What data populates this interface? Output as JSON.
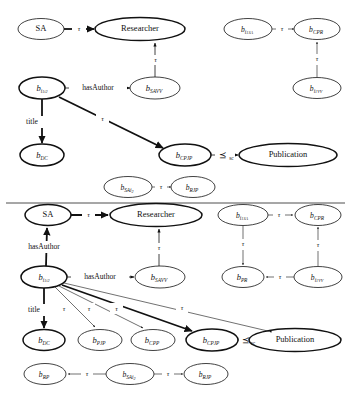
{
  "figure": {
    "type": "two-panel-graph-diagram",
    "divider_y": 203,
    "panels": [
      {
        "id": "top-panel",
        "name": "upper-graph",
        "nodes": [
          {
            "id": "t_SA",
            "label": "SA",
            "base": "SA",
            "sub": "",
            "sub2": "",
            "italic": false,
            "bold": false,
            "cx": 41,
            "cy": 29,
            "rx": 23,
            "ry": 10.5
          },
          {
            "id": "t_RES",
            "label": "Researcher",
            "base": "Researcher",
            "sub": "",
            "sub2": "",
            "italic": false,
            "bold": true,
            "cx": 140,
            "cy": 29,
            "rx": 45,
            "ry": 11.5
          },
          {
            "id": "t_BI1I2",
            "label": "b i1i2",
            "base": "b",
            "sub": "i",
            "sub2": "1i2",
            "italic": true,
            "bold": true,
            "cx": 42,
            "cy": 88,
            "rx": 23,
            "ry": 11
          },
          {
            "id": "t_BSAVV",
            "label": "b SAVV",
            "base": "b",
            "sub": "SAVV",
            "sub2": "",
            "italic": true,
            "bold": false,
            "cx": 155,
            "cy": 88,
            "rx": 25,
            "ry": 11
          },
          {
            "id": "t_BDC",
            "label": "b DC",
            "base": "b",
            "sub": "DC",
            "sub2": "",
            "italic": true,
            "bold": true,
            "cx": 42,
            "cy": 155,
            "rx": 22,
            "ry": 11
          },
          {
            "id": "t_BCPJP",
            "label": "b CPJP",
            "base": "b",
            "sub": "CPJP",
            "sub2": "",
            "italic": true,
            "bold": true,
            "cx": 185,
            "cy": 155,
            "rx": 26,
            "ry": 11
          },
          {
            "id": "t_PUB",
            "label": "Publication",
            "base": "Publication",
            "sub": "",
            "sub2": "",
            "italic": false,
            "bold": true,
            "cx": 288,
            "cy": 155,
            "rx": 49,
            "ry": 11.5
          },
          {
            "id": "t_BSAI2",
            "label": "b SAi2",
            "base": "b",
            "sub": "SAi",
            "sub2": "2",
            "italic": true,
            "bold": false,
            "cx": 128,
            "cy": 187,
            "rx": 24,
            "ry": 10.5
          },
          {
            "id": "t_BRJP",
            "label": "b RJP",
            "base": "b",
            "sub": "RJP",
            "sub2": "",
            "italic": true,
            "bold": false,
            "cx": 193,
            "cy": 187,
            "rx": 22,
            "ry": 10.5
          },
          {
            "id": "t_BI1SA",
            "label": "b i1SA",
            "base": "b",
            "sub": "i",
            "sub2": "1SA",
            "italic": true,
            "bold": false,
            "cx": 248,
            "cy": 29,
            "rx": 24,
            "ry": 10.5
          },
          {
            "id": "t_BCPR",
            "label": "b CPR",
            "base": "b",
            "sub": "CPR",
            "sub2": "",
            "italic": true,
            "bold": false,
            "cx": 317,
            "cy": 29,
            "rx": 23,
            "ry": 10.5
          },
          {
            "id": "t_BI1VV",
            "label": "b i1VV",
            "base": "b",
            "sub": "i",
            "sub2": "1VV",
            "italic": true,
            "bold": false,
            "cx": 317,
            "cy": 88,
            "rx": 24,
            "ry": 10.5
          }
        ],
        "edges": [
          {
            "from": "t_SA",
            "to": "t_RES",
            "label": "tau",
            "label_text": "τ",
            "bold": true
          },
          {
            "from": "t_BSAVV",
            "to": "t_RES",
            "label": "tau",
            "label_text": "τ",
            "bold": false
          },
          {
            "from": "t_BI1I2",
            "to": "t_BSAVV",
            "label": "hasAuthor",
            "label_text": "hasAuthor",
            "bold": false
          },
          {
            "from": "t_BI1I2",
            "to": "t_BDC",
            "label": "title",
            "label_text": "title",
            "bold": true
          },
          {
            "from": "t_BI1I2",
            "to": "t_BCPJP",
            "label": "tau",
            "label_text": "τ",
            "bold": true
          },
          {
            "from": "t_BCPJP",
            "to": "t_PUB",
            "label": "prec-sc",
            "label_text": "⪯",
            "bold": true
          },
          {
            "from": "t_BSAI2",
            "to": "t_BRJP",
            "label": "tau",
            "label_text": "τ",
            "bold": false
          },
          {
            "from": "t_BI1SA",
            "to": "t_BCPR",
            "label": "tau",
            "label_text": "τ",
            "bold": false
          },
          {
            "from": "t_BI1VV",
            "to": "t_BCPR",
            "label": "tau",
            "label_text": "τ",
            "bold": false
          }
        ]
      },
      {
        "id": "bottom-panel",
        "name": "lower-graph",
        "nodes": [
          {
            "id": "b_SA",
            "label": "SA",
            "base": "SA",
            "sub": "",
            "sub2": "",
            "italic": false,
            "bold": true,
            "cx": 48,
            "cy": 215,
            "rx": 23,
            "ry": 10.5
          },
          {
            "id": "b_RES",
            "label": "Researcher",
            "base": "Researcher",
            "sub": "",
            "sub2": "",
            "italic": false,
            "bold": true,
            "cx": 156,
            "cy": 215,
            "rx": 46,
            "ry": 11.5
          },
          {
            "id": "b_BI1SA",
            "label": "b i1SA",
            "base": "b",
            "sub": "i",
            "sub2": "1SA",
            "italic": true,
            "bold": false,
            "cx": 243,
            "cy": 215,
            "rx": 25,
            "ry": 10.5
          },
          {
            "id": "b_BCPR",
            "label": "b CPR",
            "base": "b",
            "sub": "CPR",
            "sub2": "",
            "italic": true,
            "bold": false,
            "cx": 318,
            "cy": 215,
            "rx": 23,
            "ry": 10.5
          },
          {
            "id": "b_BI1I2",
            "label": "b i1i2",
            "base": "b",
            "sub": "i",
            "sub2": "1i2",
            "italic": true,
            "bold": true,
            "cx": 44,
            "cy": 277,
            "rx": 23,
            "ry": 11
          },
          {
            "id": "b_BSAVV",
            "label": "b SAVV",
            "base": "b",
            "sub": "SAVV",
            "sub2": "",
            "italic": true,
            "bold": false,
            "cx": 160,
            "cy": 277,
            "rx": 25,
            "ry": 11
          },
          {
            "id": "b_BPR",
            "label": "b PR",
            "base": "b",
            "sub": "PR",
            "sub2": "",
            "italic": true,
            "bold": false,
            "cx": 243,
            "cy": 277,
            "rx": 21,
            "ry": 10.5
          },
          {
            "id": "b_BI1VV",
            "label": "b i1VV",
            "base": "b",
            "sub": "i",
            "sub2": "1VV",
            "italic": true,
            "bold": false,
            "cx": 318,
            "cy": 277,
            "rx": 24,
            "ry": 10.5
          },
          {
            "id": "b_BDC",
            "label": "b DC",
            "base": "b",
            "sub": "DC",
            "sub2": "",
            "italic": true,
            "bold": true,
            "cx": 44,
            "cy": 340,
            "rx": 21,
            "ry": 10.5
          },
          {
            "id": "b_BPJP",
            "label": "b PJP",
            "base": "b",
            "sub": "PJP",
            "sub2": "",
            "italic": true,
            "bold": false,
            "cx": 100,
            "cy": 340,
            "rx": 22,
            "ry": 10.5
          },
          {
            "id": "b_BCPP",
            "label": "b CPP",
            "base": "b",
            "sub": "CPP",
            "sub2": "",
            "italic": true,
            "bold": false,
            "cx": 153,
            "cy": 340,
            "rx": 22,
            "ry": 10.5
          },
          {
            "id": "b_BCPJP",
            "label": "b CPJP",
            "base": "b",
            "sub": "CPJP",
            "sub2": "",
            "italic": true,
            "bold": true,
            "cx": 212,
            "cy": 340,
            "rx": 26,
            "ry": 11
          },
          {
            "id": "b_PUB",
            "label": "Publication",
            "base": "Publication",
            "sub": "",
            "sub2": "",
            "italic": false,
            "bold": true,
            "cx": 295,
            "cy": 340,
            "rx": 46,
            "ry": 11.5
          },
          {
            "id": "b_BRP",
            "label": "b RP",
            "base": "b",
            "sub": "RP",
            "sub2": "",
            "italic": true,
            "bold": false,
            "cx": 45,
            "cy": 374,
            "rx": 21,
            "ry": 10.5
          },
          {
            "id": "b_BSAI2",
            "label": "b SAi2",
            "base": "b",
            "sub": "SAi",
            "sub2": "2",
            "italic": true,
            "bold": false,
            "cx": 130,
            "cy": 374,
            "rx": 24,
            "ry": 10.5
          },
          {
            "id": "b_BRJP",
            "label": "b RJP",
            "base": "b",
            "sub": "RJP",
            "sub2": "",
            "italic": true,
            "bold": false,
            "cx": 206,
            "cy": 374,
            "rx": 22,
            "ry": 10.5
          }
        ],
        "edges": [
          {
            "from": "b_SA",
            "to": "b_RES",
            "label": "tau",
            "label_text": "τ",
            "bold": true
          },
          {
            "from": "b_BSAVV",
            "to": "b_RES",
            "label": "tau",
            "label_text": "τ",
            "bold": false
          },
          {
            "from": "b_BI1I2",
            "to": "b_SA",
            "label": "hasAuthor",
            "label_text": "hasAuthor",
            "bold": true
          },
          {
            "from": "b_BI1I2",
            "to": "b_BSAVV",
            "label": "hasAuthor",
            "label_text": "hasAuthor",
            "bold": false
          },
          {
            "from": "b_BI1I2",
            "to": "b_BDC",
            "label": "title",
            "label_text": "title",
            "bold": true
          },
          {
            "from": "b_BI1I2",
            "to": "b_BPJP",
            "label": "tau",
            "label_text": "τ",
            "bold": false
          },
          {
            "from": "b_BI1I2",
            "to": "b_BCPP",
            "label": "tau",
            "label_text": "τ",
            "bold": false
          },
          {
            "from": "b_BI1I2",
            "to": "b_BCPJP",
            "label": "tau",
            "label_text": "τ",
            "bold": true
          },
          {
            "from": "b_BI1I2",
            "to": "b_PUB",
            "label": "tau",
            "label_text": "τ",
            "bold": false
          },
          {
            "from": "b_BCPJP",
            "to": "b_PUB",
            "label": "prec-sc",
            "label_text": "⪯",
            "bold": true
          },
          {
            "from": "b_BI1SA",
            "to": "b_BCPR",
            "label": "tau",
            "label_text": "τ",
            "bold": false
          },
          {
            "from": "b_BI1SA",
            "to": "b_BPR",
            "label": "tau",
            "label_text": "τ",
            "bold": false
          },
          {
            "from": "b_BI1VV",
            "to": "b_BCPR",
            "label": "tau",
            "label_text": "τ",
            "bold": false
          },
          {
            "from": "b_BI1VV",
            "to": "b_BPR",
            "label": "tau",
            "label_text": "τ",
            "bold": false
          },
          {
            "from": "b_BSAI2",
            "to": "b_BRP",
            "label": "tau",
            "label_text": "τ",
            "bold": false
          },
          {
            "from": "b_BSAI2",
            "to": "b_BRJP",
            "label": "tau",
            "label_text": "τ",
            "bold": false
          }
        ]
      }
    ],
    "labels": {
      "tau": "τ",
      "hasAuthor": "hasAuthor",
      "title": "title",
      "prec": "⪯",
      "prec_sub": "sc",
      "SA": "SA",
      "Researcher": "Researcher",
      "Publication": "Publication",
      "b": "b",
      "sub_i": "i",
      "sub_1i2": "1i2",
      "sub_1SA": "1SA",
      "sub_1VV": "1VV",
      "sub_SAVV": "SAVV",
      "sub_DC": "DC",
      "sub_CPJP": "CPJP",
      "sub_CPR": "CPR",
      "sub_RJP": "RJP",
      "sub_PR": "PR",
      "sub_PJP": "PJP",
      "sub_CPP": "CPP",
      "sub_RP": "RP",
      "sub_SAi": "SAi",
      "sub_2": "2"
    },
    "colors": {
      "stroke": "#111111",
      "background": "#ffffff",
      "divider": "#3a3a3a"
    }
  }
}
